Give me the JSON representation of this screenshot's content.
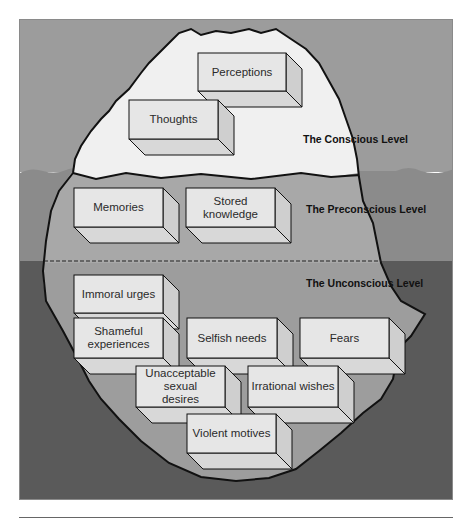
{
  "diagram": {
    "type": "iceberg",
    "colors": {
      "sky": "#9c9c9c",
      "shallow_water": "#8b8b8b",
      "deep_water": "#5a5a5a",
      "iceberg_tip": "#f0f0f0",
      "iceberg_submerged": "#a9a9a9",
      "iceberg_deep": "#9a9a9a",
      "box_front": "#e6e6e6",
      "box_side": "#cfcfcf",
      "box_bottom": "#d8d8d8",
      "outline": "#111111"
    },
    "levels": [
      {
        "name": "The Conscious Level",
        "items": [
          "Perceptions",
          "Thoughts"
        ]
      },
      {
        "name": "The Preconscious Level",
        "items": [
          "Memories",
          "Stored knowledge"
        ]
      },
      {
        "name": "The Unconscious Level",
        "items": [
          "Immoral urges",
          "Shameful experiences",
          "Selfish needs",
          "Fears",
          "Unacceptable sexual desires",
          "Irrational wishes",
          "Violent motives"
        ]
      }
    ],
    "boxes": [
      {
        "id": "perceptions",
        "lines": [
          "Perceptions"
        ],
        "x": 198,
        "y": 53,
        "w": 88,
        "h": 38
      },
      {
        "id": "thoughts",
        "lines": [
          "Thoughts"
        ],
        "x": 129,
        "y": 100,
        "w": 89,
        "h": 39
      },
      {
        "id": "memories",
        "lines": [
          "Memories"
        ],
        "x": 74,
        "y": 188,
        "w": 89,
        "h": 39
      },
      {
        "id": "stored-knowledge",
        "lines": [
          "Stored",
          "knowledge"
        ],
        "x": 186,
        "y": 188,
        "w": 89,
        "h": 39
      },
      {
        "id": "immoral-urges",
        "lines": [
          "Immoral urges"
        ],
        "x": 74,
        "y": 275,
        "w": 89,
        "h": 38
      },
      {
        "id": "shameful-experiences",
        "lines": [
          "Shameful",
          "experiences"
        ],
        "x": 74,
        "y": 318,
        "w": 89,
        "h": 40
      },
      {
        "id": "selfish-needs",
        "lines": [
          "Selfish needs"
        ],
        "x": 187,
        "y": 318,
        "w": 90,
        "h": 40
      },
      {
        "id": "fears",
        "lines": [
          "Fears"
        ],
        "x": 300,
        "y": 318,
        "w": 89,
        "h": 40
      },
      {
        "id": "unacceptable-sexual-desires",
        "lines": [
          "Unacceptable",
          "sexual",
          "desires"
        ],
        "x": 136,
        "y": 366,
        "w": 89,
        "h": 41
      },
      {
        "id": "irrational-wishes",
        "lines": [
          "Irrational wishes"
        ],
        "x": 248,
        "y": 366,
        "w": 90,
        "h": 41
      },
      {
        "id": "violent-motives",
        "lines": [
          "Violent motives"
        ],
        "x": 187,
        "y": 414,
        "w": 89,
        "h": 39
      }
    ],
    "level_labels": [
      {
        "text": "The Conscious Level",
        "x": 303,
        "y": 133
      },
      {
        "text": "The Preconscious Level",
        "x": 306,
        "y": 203
      },
      {
        "text": "The Unconscious Level",
        "x": 306,
        "y": 277
      }
    ]
  }
}
